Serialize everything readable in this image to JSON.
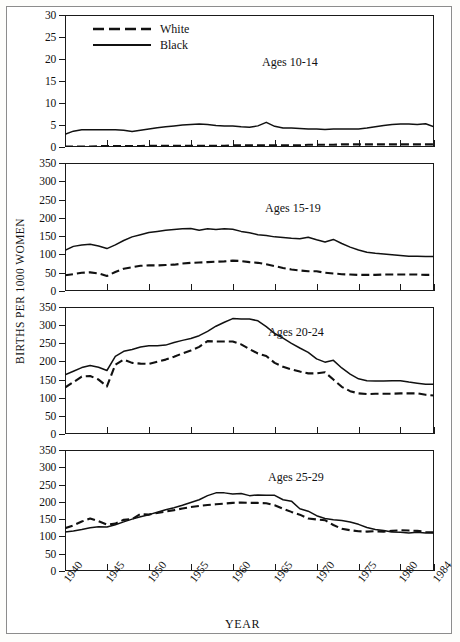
{
  "figure": {
    "ylabel": "BIRTHS PER 1000 WOMEN",
    "xlabel": "YEAR"
  },
  "legend": {
    "position": "top-left-panel-1",
    "entries": [
      {
        "label": "White",
        "style": "dashed",
        "color": "#111111"
      },
      {
        "label": "Black",
        "style": "solid",
        "color": "#111111"
      }
    ]
  },
  "chart_data": [
    {
      "type": "line",
      "title": "Ages 10-14",
      "xlabel": "YEAR",
      "ylabel": "BIRTHS PER 1000 WOMEN",
      "xlim": [
        1940,
        1984
      ],
      "ylim": [
        0,
        30
      ],
      "yticks": [
        0,
        5,
        10,
        15,
        20,
        25,
        30
      ],
      "xticks": [
        1940,
        1945,
        1950,
        1955,
        1960,
        1965,
        1970,
        1975,
        1980,
        1984
      ],
      "grid": false,
      "x": [
        1940,
        1941,
        1942,
        1943,
        1944,
        1945,
        1946,
        1947,
        1948,
        1949,
        1950,
        1951,
        1952,
        1953,
        1954,
        1955,
        1956,
        1957,
        1958,
        1959,
        1960,
        1961,
        1962,
        1963,
        1964,
        1965,
        1966,
        1967,
        1968,
        1969,
        1970,
        1971,
        1972,
        1973,
        1974,
        1975,
        1976,
        1977,
        1978,
        1979,
        1980,
        1981,
        1982,
        1983,
        1984
      ],
      "series": [
        {
          "name": "White",
          "style": "dashed",
          "values": [
            0.1,
            0.1,
            0.1,
            0.1,
            0.2,
            0.2,
            0.2,
            0.2,
            0.2,
            0.2,
            0.3,
            0.3,
            0.3,
            0.3,
            0.3,
            0.3,
            0.3,
            0.3,
            0.3,
            0.3,
            0.4,
            0.4,
            0.4,
            0.4,
            0.4,
            0.4,
            0.4,
            0.4,
            0.4,
            0.5,
            0.5,
            0.5,
            0.5,
            0.6,
            0.6,
            0.6,
            0.6,
            0.6,
            0.6,
            0.6,
            0.6,
            0.6,
            0.6,
            0.6,
            0.6
          ]
        },
        {
          "name": "Black",
          "style": "solid",
          "values": [
            2.9,
            3.6,
            3.9,
            3.9,
            3.9,
            3.9,
            3.9,
            3.8,
            3.5,
            3.8,
            4.1,
            4.4,
            4.6,
            4.8,
            5.0,
            5.1,
            5.2,
            5.1,
            4.9,
            4.8,
            4.8,
            4.6,
            4.5,
            4.8,
            5.6,
            4.7,
            4.3,
            4.3,
            4.2,
            4.1,
            4.1,
            4.0,
            4.1,
            4.1,
            4.1,
            4.1,
            4.3,
            4.6,
            4.9,
            5.1,
            5.2,
            5.2,
            5.1,
            5.3,
            4.6
          ]
        }
      ]
    },
    {
      "type": "line",
      "title": "Ages 15-19",
      "xlabel": "YEAR",
      "ylabel": "BIRTHS PER 1000 WOMEN",
      "xlim": [
        1940,
        1984
      ],
      "ylim": [
        0,
        350
      ],
      "yticks": [
        0,
        50,
        100,
        150,
        200,
        250,
        300,
        350
      ],
      "xticks": [
        1940,
        1945,
        1950,
        1955,
        1960,
        1965,
        1970,
        1975,
        1980,
        1984
      ],
      "grid": false,
      "x": [
        1940,
        1941,
        1942,
        1943,
        1944,
        1945,
        1946,
        1947,
        1948,
        1949,
        1950,
        1951,
        1952,
        1953,
        1954,
        1955,
        1956,
        1957,
        1958,
        1959,
        1960,
        1961,
        1962,
        1963,
        1964,
        1965,
        1966,
        1967,
        1968,
        1969,
        1970,
        1971,
        1972,
        1973,
        1974,
        1975,
        1976,
        1977,
        1978,
        1979,
        1980,
        1981,
        1982,
        1983,
        1984
      ],
      "series": [
        {
          "name": "White",
          "style": "dashed",
          "values": [
            43,
            46,
            50,
            51,
            48,
            41,
            52,
            61,
            65,
            69,
            70,
            70,
            71,
            72,
            75,
            77,
            78,
            79,
            80,
            81,
            83,
            82,
            79,
            77,
            73,
            68,
            63,
            59,
            56,
            54,
            54,
            50,
            48,
            46,
            45,
            44,
            44,
            44,
            45,
            45,
            45,
            45,
            45,
            44,
            44
          ]
        },
        {
          "name": "Black",
          "style": "solid",
          "values": [
            111,
            122,
            126,
            128,
            123,
            116,
            126,
            138,
            148,
            154,
            160,
            163,
            166,
            168,
            170,
            171,
            166,
            170,
            168,
            170,
            169,
            163,
            159,
            154,
            152,
            148,
            146,
            144,
            143,
            147,
            140,
            134,
            141,
            130,
            120,
            112,
            106,
            103,
            101,
            99,
            97,
            95,
            95,
            94,
            94
          ]
        }
      ]
    },
    {
      "type": "line",
      "title": "Ages 20-24",
      "xlabel": "YEAR",
      "ylabel": "BIRTHS PER 1000 WOMEN",
      "xlim": [
        1940,
        1984
      ],
      "ylim": [
        0,
        350
      ],
      "yticks": [
        0,
        50,
        100,
        150,
        200,
        250,
        300,
        350
      ],
      "xticks": [
        1940,
        1945,
        1950,
        1955,
        1960,
        1965,
        1970,
        1975,
        1980,
        1984
      ],
      "grid": false,
      "x": [
        1940,
        1941,
        1942,
        1943,
        1944,
        1945,
        1946,
        1947,
        1948,
        1949,
        1950,
        1951,
        1952,
        1953,
        1954,
        1955,
        1956,
        1957,
        1958,
        1959,
        1960,
        1961,
        1962,
        1963,
        1964,
        1965,
        1966,
        1967,
        1968,
        1969,
        1970,
        1971,
        1972,
        1973,
        1974,
        1975,
        1976,
        1977,
        1978,
        1979,
        1980,
        1981,
        1982,
        1983,
        1984
      ],
      "series": [
        {
          "name": "White",
          "style": "dashed",
          "values": [
            128,
            143,
            158,
            160,
            150,
            131,
            191,
            205,
            196,
            194,
            193,
            199,
            205,
            213,
            222,
            230,
            240,
            256,
            255,
            255,
            255,
            247,
            234,
            222,
            215,
            196,
            185,
            178,
            172,
            167,
            167,
            170,
            150,
            130,
            118,
            112,
            110,
            111,
            111,
            111,
            112,
            112,
            112,
            108,
            106
          ]
        },
        {
          "name": "Black",
          "style": "solid",
          "values": [
            163,
            173,
            183,
            189,
            184,
            175,
            214,
            228,
            233,
            240,
            243,
            243,
            245,
            252,
            258,
            263,
            271,
            283,
            297,
            308,
            318,
            317,
            317,
            312,
            296,
            277,
            264,
            250,
            237,
            225,
            207,
            198,
            203,
            182,
            165,
            152,
            147,
            146,
            146,
            147,
            147,
            143,
            140,
            137,
            137
          ]
        }
      ]
    },
    {
      "type": "line",
      "title": "Ages 25-29",
      "xlabel": "YEAR",
      "ylabel": "BIRTHS PER 1000 WOMEN",
      "xlim": [
        1940,
        1984
      ],
      "ylim": [
        0,
        350
      ],
      "yticks": [
        0,
        50,
        100,
        150,
        200,
        250,
        300,
        350
      ],
      "xticks": [
        1940,
        1945,
        1950,
        1955,
        1960,
        1965,
        1970,
        1975,
        1980,
        1984
      ],
      "grid": false,
      "x": [
        1940,
        1941,
        1942,
        1943,
        1944,
        1945,
        1946,
        1947,
        1948,
        1949,
        1950,
        1951,
        1952,
        1953,
        1954,
        1955,
        1956,
        1957,
        1958,
        1959,
        1960,
        1961,
        1962,
        1963,
        1964,
        1965,
        1966,
        1967,
        1968,
        1969,
        1970,
        1971,
        1972,
        1973,
        1974,
        1975,
        1976,
        1977,
        1978,
        1979,
        1980,
        1981,
        1982,
        1983,
        1984
      ],
      "series": [
        {
          "name": "White",
          "style": "dashed",
          "values": [
            124,
            132,
            143,
            152,
            144,
            134,
            137,
            148,
            150,
            165,
            163,
            168,
            172,
            176,
            181,
            185,
            188,
            191,
            193,
            195,
            197,
            198,
            197,
            197,
            196,
            190,
            180,
            171,
            163,
            152,
            149,
            147,
            133,
            122,
            118,
            115,
            114,
            115,
            114,
            116,
            118,
            117,
            116,
            113,
            112
          ]
        },
        {
          "name": "Black",
          "style": "solid",
          "values": [
            113,
            116,
            120,
            125,
            128,
            127,
            134,
            142,
            150,
            157,
            163,
            170,
            177,
            183,
            190,
            198,
            206,
            218,
            226,
            226,
            223,
            224,
            218,
            220,
            219,
            219,
            206,
            202,
            180,
            173,
            160,
            152,
            148,
            146,
            142,
            135,
            126,
            120,
            117,
            113,
            112,
            110,
            112,
            110,
            110
          ]
        }
      ]
    }
  ]
}
